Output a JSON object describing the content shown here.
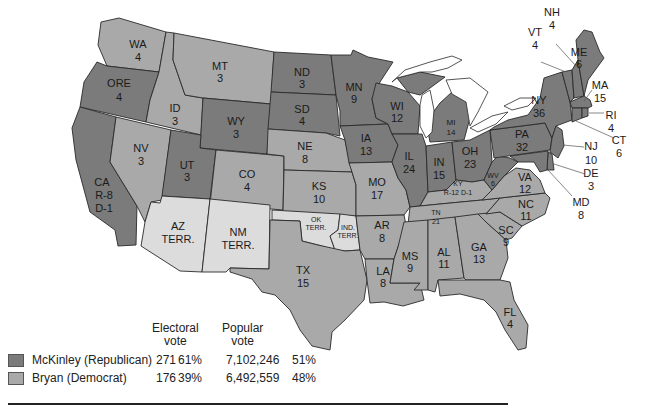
{
  "map": {
    "title": "Election of 1900",
    "colors": {
      "republican": "#7b7b7b",
      "democrat": "#a9a9a9",
      "territory": "#dcdcdc",
      "water": "#ffffff"
    },
    "states": {
      "WA": {
        "name": "WA",
        "votes": "4",
        "party": "democrat"
      },
      "ORE": {
        "name": "ORE",
        "votes": "4",
        "party": "republican"
      },
      "CA": {
        "name": "CA",
        "votes_r": "R-8",
        "votes_d": "D-1",
        "party": "republican"
      },
      "ID": {
        "name": "ID",
        "votes": "3",
        "party": "democrat"
      },
      "NV": {
        "name": "NV",
        "votes": "3",
        "party": "democrat"
      },
      "MT": {
        "name": "MT",
        "votes": "3",
        "party": "democrat"
      },
      "WY": {
        "name": "WY",
        "votes": "3",
        "party": "republican"
      },
      "UT": {
        "name": "UT",
        "votes": "3",
        "party": "republican"
      },
      "CO": {
        "name": "CO",
        "votes": "4",
        "party": "democrat"
      },
      "AZ": {
        "name": "AZ",
        "votes": "TERR.",
        "party": "territory"
      },
      "NM": {
        "name": "NM",
        "votes": "TERR.",
        "party": "territory"
      },
      "ND": {
        "name": "ND",
        "votes": "3",
        "party": "republican"
      },
      "SD": {
        "name": "SD",
        "votes": "4",
        "party": "republican"
      },
      "NE": {
        "name": "NE",
        "votes": "8",
        "party": "republican"
      },
      "KS": {
        "name": "KS",
        "votes": "10",
        "party": "republican"
      },
      "OK": {
        "name": "OK",
        "votes": "TERR.",
        "party": "territory"
      },
      "IND": {
        "name": "IND.",
        "votes": "TERR.",
        "party": "territory"
      },
      "TX": {
        "name": "TX",
        "votes": "15",
        "party": "democrat"
      },
      "MN": {
        "name": "MN",
        "votes": "9",
        "party": "republican"
      },
      "IA": {
        "name": "IA",
        "votes": "13",
        "party": "republican"
      },
      "MO": {
        "name": "MO",
        "votes": "17",
        "party": "democrat"
      },
      "AR": {
        "name": "AR",
        "votes": "8",
        "party": "democrat"
      },
      "LA": {
        "name": "LA",
        "votes": "8",
        "party": "democrat"
      },
      "WI": {
        "name": "WI",
        "votes": "12",
        "party": "republican"
      },
      "IL": {
        "name": "IL",
        "votes": "24",
        "party": "republican"
      },
      "MI": {
        "name": "MI",
        "votes": "14",
        "party": "republican"
      },
      "IN": {
        "name": "IN",
        "votes": "15",
        "party": "republican"
      },
      "OH": {
        "name": "OH",
        "votes": "23",
        "party": "republican"
      },
      "KY": {
        "name": "KY",
        "votes": "R-12 D-1",
        "party": "democrat"
      },
      "TN": {
        "name": "TN",
        "votes": "21",
        "party": "democrat"
      },
      "MS": {
        "name": "MS",
        "votes": "9",
        "party": "democrat"
      },
      "AL": {
        "name": "AL",
        "votes": "11",
        "party": "democrat"
      },
      "GA": {
        "name": "GA",
        "votes": "13",
        "party": "democrat"
      },
      "FL": {
        "name": "FL",
        "votes": "4",
        "party": "democrat"
      },
      "SC": {
        "name": "SC",
        "votes": "9",
        "party": "democrat"
      },
      "NC": {
        "name": "NC",
        "votes": "11",
        "party": "democrat"
      },
      "VA": {
        "name": "VA",
        "votes": "12",
        "party": "democrat"
      },
      "WV": {
        "name": "WV",
        "votes": "6",
        "party": "republican"
      },
      "PA": {
        "name": "PA",
        "votes": "32",
        "party": "republican"
      },
      "NY": {
        "name": "NY",
        "votes": "36",
        "party": "republican"
      },
      "VT": {
        "name": "VT",
        "votes": "4",
        "party": "republican"
      },
      "NH": {
        "name": "NH",
        "votes": "4",
        "party": "republican"
      },
      "ME": {
        "name": "ME",
        "votes": "6",
        "party": "republican"
      },
      "MA": {
        "name": "MA",
        "votes": "15",
        "party": "republican"
      },
      "RI": {
        "name": "RI",
        "votes": "4",
        "party": "republican"
      },
      "CT": {
        "name": "CT",
        "votes": "6",
        "party": "republican"
      },
      "NJ": {
        "name": "NJ",
        "votes": "10",
        "party": "republican"
      },
      "DE": {
        "name": "DE",
        "votes": "3",
        "party": "republican"
      },
      "MD": {
        "name": "MD",
        "votes": "8",
        "party": "republican"
      }
    }
  },
  "legend": {
    "col_electoral": "Electoral\nvote",
    "col_electoral_l1": "Electoral",
    "col_electoral_l2": "vote",
    "col_popular_l1": "Popular",
    "col_popular_l2": "vote",
    "rows": [
      {
        "candidate": "McKinley (Republican)",
        "electoral": "271",
        "electoral_pct": "61%",
        "popular": "7,102,246",
        "popular_pct": "51%",
        "color": "#7b7b7b"
      },
      {
        "candidate": "Bryan (Democrat)",
        "electoral": "176",
        "electoral_pct": "39%",
        "popular": "6,492,559",
        "popular_pct": "48%",
        "color": "#a9a9a9"
      }
    ]
  }
}
